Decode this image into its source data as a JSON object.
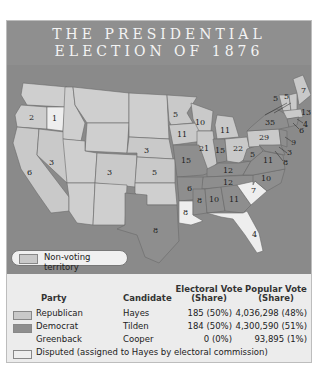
{
  "title": {
    "line1": "THE PRESIDENTIAL",
    "line2": "ELECTION OF 1876"
  },
  "colors": {
    "title_band": "#8f8f8f",
    "water": "#8a8a8a",
    "republican": "#c9c9c9",
    "democrat": "#8e8e8e",
    "disputed": "#eeeeee",
    "non_voting": "#cfcfcf",
    "background": "#ececec"
  },
  "map": {
    "non_voting_label": "Non-voting territory",
    "states": [
      {
        "name": "Oregon",
        "votes": "2",
        "party": "disputed"
      },
      {
        "name": "Oregon-elector",
        "votes": "1",
        "party": "disputed"
      },
      {
        "name": "California",
        "votes": "6",
        "party": "republican"
      },
      {
        "name": "Nevada",
        "votes": "3",
        "party": "republican"
      },
      {
        "name": "Colorado",
        "votes": "3",
        "party": "republican"
      },
      {
        "name": "Nebraska",
        "votes": "3",
        "party": "republican"
      },
      {
        "name": "Kansas",
        "votes": "5",
        "party": "republican"
      },
      {
        "name": "Minnesota",
        "votes": "5",
        "party": "republican"
      },
      {
        "name": "Iowa",
        "votes": "11",
        "party": "republican"
      },
      {
        "name": "Wisconsin",
        "votes": "10",
        "party": "republican"
      },
      {
        "name": "Michigan",
        "votes": "11",
        "party": "republican"
      },
      {
        "name": "Illinois",
        "votes": "21",
        "party": "republican"
      },
      {
        "name": "Indiana",
        "votes": "15",
        "party": "democrat"
      },
      {
        "name": "Ohio",
        "votes": "22",
        "party": "republican"
      },
      {
        "name": "Pennsylvania",
        "votes": "29",
        "party": "republican"
      },
      {
        "name": "New York",
        "votes": "35",
        "party": "democrat"
      },
      {
        "name": "Vermont",
        "votes": "5",
        "party": "republican"
      },
      {
        "name": "New Hampshire",
        "votes": "5",
        "party": "republican"
      },
      {
        "name": "Maine",
        "votes": "7",
        "party": "republican"
      },
      {
        "name": "Massachusetts",
        "votes": "13",
        "party": "republican"
      },
      {
        "name": "Rhode Island",
        "votes": "4",
        "party": "republican"
      },
      {
        "name": "Connecticut",
        "votes": "6",
        "party": "democrat"
      },
      {
        "name": "New Jersey",
        "votes": "9",
        "party": "democrat"
      },
      {
        "name": "Delaware",
        "votes": "3",
        "party": "democrat"
      },
      {
        "name": "Maryland",
        "votes": "8",
        "party": "democrat"
      },
      {
        "name": "West Virginia",
        "votes": "5",
        "party": "democrat"
      },
      {
        "name": "Virginia",
        "votes": "11",
        "party": "democrat"
      },
      {
        "name": "Missouri",
        "votes": "15",
        "party": "democrat"
      },
      {
        "name": "Kentucky",
        "votes": "12",
        "party": "democrat"
      },
      {
        "name": "Tennessee",
        "votes": "12",
        "party": "democrat"
      },
      {
        "name": "North Carolina",
        "votes": "10",
        "party": "democrat"
      },
      {
        "name": "South Carolina",
        "votes": "7",
        "party": "disputed"
      },
      {
        "name": "Arkansas",
        "votes": "6",
        "party": "democrat"
      },
      {
        "name": "Texas",
        "votes": "8",
        "party": "democrat"
      },
      {
        "name": "Louisiana",
        "votes": "8",
        "party": "disputed"
      },
      {
        "name": "Mississippi",
        "votes": "8",
        "party": "democrat"
      },
      {
        "name": "Alabama",
        "votes": "10",
        "party": "democrat"
      },
      {
        "name": "Georgia",
        "votes": "11",
        "party": "democrat"
      },
      {
        "name": "Florida",
        "votes": "4",
        "party": "disputed"
      }
    ]
  },
  "legend": {
    "headers": {
      "party": "Party",
      "candidate": "Candidate",
      "electoral_line1": "Electoral Vote",
      "electoral_line2": "(Share)",
      "popular_line1": "Popular Vote",
      "popular_line2": "(Share)"
    },
    "rows": [
      {
        "party": "Republican",
        "candidate": "Hayes",
        "electoral": "185 (50%)",
        "popular": "4,036,298 (48%)",
        "swatch": "republican"
      },
      {
        "party": "Democrat",
        "candidate": "Tilden",
        "electoral": "184 (50%)",
        "popular": "4,300,590 (51%)",
        "swatch": "democrat"
      },
      {
        "party": "Greenback",
        "candidate": "Cooper",
        "electoral": "0 (0%)",
        "popular": "93,895 (1%)",
        "swatch": ""
      }
    ],
    "disputed_label": "Disputed (assigned to Hayes by electoral commission)"
  }
}
